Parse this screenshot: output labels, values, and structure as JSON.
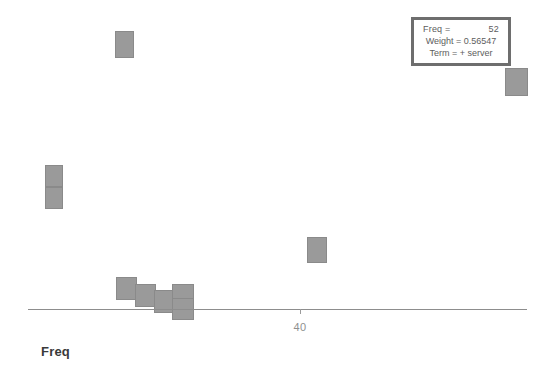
{
  "axis": {
    "title": "Freq",
    "ticks": [
      {
        "label": "40",
        "x": 300
      }
    ]
  },
  "tooltip": {
    "freq_key": "Freq =",
    "freq_value": "52",
    "weight_line": "Weight = 0.56547",
    "term_line": "Term = + server"
  },
  "colors": {
    "marker_fill": "#9a9a9a",
    "marker_border": "#8a8a8a",
    "tooltip_border": "#6e6e6e",
    "axis_line": "#8d8d8d",
    "axis_title": "#3a3a3a",
    "tick_label": "#8f8f8f"
  },
  "chart_data": {
    "type": "scatter",
    "title": "",
    "xlabel": "Freq",
    "ylabel": "",
    "grid": false,
    "legend": "none",
    "xticks": [
      "40"
    ],
    "marker": "square",
    "points": [
      {
        "x": 124,
        "y": 44,
        "w": 19,
        "h": 27
      },
      {
        "x": 516,
        "y": 82,
        "w": 23,
        "h": 28
      },
      {
        "x": 54,
        "y": 176,
        "w": 18,
        "h": 22
      },
      {
        "x": 54,
        "y": 198,
        "w": 18,
        "h": 22
      },
      {
        "x": 317,
        "y": 250,
        "w": 20,
        "h": 26
      },
      {
        "x": 126,
        "y": 288,
        "w": 21,
        "h": 23
      },
      {
        "x": 145,
        "y": 295,
        "w": 21,
        "h": 23
      },
      {
        "x": 164,
        "y": 301,
        "w": 21,
        "h": 23
      },
      {
        "x": 183,
        "y": 296,
        "w": 22,
        "h": 24
      },
      {
        "x": 183,
        "y": 309,
        "w": 22,
        "h": 22
      }
    ]
  }
}
